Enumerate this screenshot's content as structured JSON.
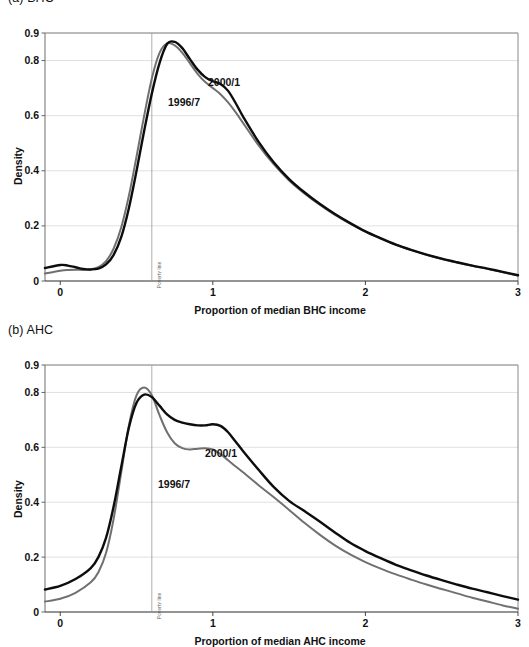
{
  "figure": {
    "panels": [
      {
        "id": "a",
        "title": "(a) BHC",
        "ylabel": "Density",
        "xlabel": "Proportion of median BHC income",
        "yticks": [
          "0",
          "0.2",
          "0.4",
          "0.6",
          "0.8",
          "0.9"
        ],
        "xticks": [
          "0",
          "1",
          "2",
          "3"
        ],
        "poverty_label": "Poverty line",
        "series_labels": {
          "new": "2000/1",
          "old": "1996/7"
        }
      },
      {
        "id": "b",
        "title": "(b) AHC",
        "ylabel": "Density",
        "xlabel": "Proportion of median AHC income",
        "yticks": [
          "0",
          "0.2",
          "0.4",
          "0.6",
          "0.8",
          "0.9"
        ],
        "xticks": [
          "0",
          "1",
          "2",
          "3"
        ],
        "poverty_label": "Poverty line",
        "series_labels": {
          "new": "2000/1",
          "old": "1996/7"
        }
      }
    ]
  },
  "colors": {
    "series_new": "#0d0d0d",
    "series_old": "#707070",
    "grid": "#d8d8d8",
    "axis": "#7a7a7a",
    "poverty_line": "#9a9a9a",
    "background": "#ffffff"
  },
  "chart_data": [
    {
      "type": "line",
      "title": "(a) BHC",
      "xlabel": "Proportion of median BHC income",
      "ylabel": "Density",
      "xlim": [
        -0.1,
        3.0
      ],
      "ylim": [
        0,
        0.9
      ],
      "xticks": [
        0,
        1,
        2,
        3
      ],
      "yticks": [
        0,
        0.2,
        0.4,
        0.6,
        0.8,
        0.9
      ],
      "grid": true,
      "legend": "inline-annotations",
      "annotations": [
        {
          "text": "Poverty line",
          "x": 0.6,
          "orientation": "vertical"
        },
        {
          "text": "2000/1",
          "x": 1.02,
          "y": 0.745,
          "series": "2000/1"
        },
        {
          "text": "1996/7",
          "x": 0.82,
          "y": 0.675,
          "series": "1996/7"
        }
      ],
      "x": [
        -0.1,
        0.0,
        0.05,
        0.1,
        0.15,
        0.2,
        0.25,
        0.3,
        0.35,
        0.4,
        0.45,
        0.5,
        0.55,
        0.6,
        0.65,
        0.7,
        0.75,
        0.8,
        0.85,
        0.9,
        0.95,
        1.0,
        1.05,
        1.1,
        1.15,
        1.2,
        1.3,
        1.4,
        1.5,
        1.6,
        1.7,
        1.8,
        1.9,
        2.0,
        2.1,
        2.2,
        2.3,
        2.4,
        2.5,
        2.6,
        2.7,
        2.8,
        2.9,
        3.0
      ],
      "series": [
        {
          "name": "2000/1",
          "color": "#0d0d0d",
          "values": [
            0.047,
            0.058,
            0.056,
            0.05,
            0.044,
            0.042,
            0.045,
            0.06,
            0.095,
            0.16,
            0.265,
            0.4,
            0.545,
            0.68,
            0.79,
            0.86,
            0.868,
            0.845,
            0.805,
            0.767,
            0.74,
            0.725,
            0.715,
            0.69,
            0.645,
            0.595,
            0.505,
            0.43,
            0.37,
            0.322,
            0.28,
            0.243,
            0.21,
            0.18,
            0.155,
            0.132,
            0.113,
            0.096,
            0.081,
            0.068,
            0.056,
            0.045,
            0.033,
            0.021
          ]
        },
        {
          "name": "1996/7",
          "color": "#707070",
          "values": [
            0.027,
            0.037,
            0.04,
            0.041,
            0.04,
            0.042,
            0.05,
            0.072,
            0.118,
            0.195,
            0.31,
            0.452,
            0.6,
            0.735,
            0.827,
            0.862,
            0.855,
            0.828,
            0.79,
            0.752,
            0.722,
            0.7,
            0.678,
            0.648,
            0.612,
            0.572,
            0.492,
            0.423,
            0.365,
            0.318,
            0.277,
            0.24,
            0.208,
            0.179,
            0.154,
            0.131,
            0.112,
            0.095,
            0.08,
            0.067,
            0.055,
            0.044,
            0.032,
            0.02
          ]
        }
      ]
    },
    {
      "type": "line",
      "title": "(b) AHC",
      "xlabel": "Proportion of median AHC income",
      "ylabel": "Density",
      "xlim": [
        -0.1,
        3.0
      ],
      "ylim": [
        0,
        0.9
      ],
      "xticks": [
        0,
        1,
        2,
        3
      ],
      "yticks": [
        0,
        0.2,
        0.4,
        0.6,
        0.8,
        0.9
      ],
      "grid": true,
      "legend": "inline-annotations",
      "annotations": [
        {
          "text": "Poverty line",
          "x": 0.6,
          "orientation": "vertical"
        },
        {
          "text": "2000/1",
          "x": 1.05,
          "y": 0.685,
          "series": "2000/1"
        },
        {
          "text": "1996/7",
          "x": 0.82,
          "y": 0.575,
          "series": "1996/7"
        }
      ],
      "x": [
        -0.1,
        0.0,
        0.1,
        0.2,
        0.25,
        0.3,
        0.35,
        0.4,
        0.45,
        0.5,
        0.55,
        0.6,
        0.65,
        0.7,
        0.75,
        0.8,
        0.85,
        0.9,
        0.95,
        1.0,
        1.05,
        1.1,
        1.15,
        1.2,
        1.3,
        1.4,
        1.5,
        1.6,
        1.7,
        1.8,
        1.9,
        2.0,
        2.1,
        2.2,
        2.3,
        2.4,
        2.5,
        2.6,
        2.7,
        2.8,
        2.9,
        3.0
      ],
      "series": [
        {
          "name": "2000/1",
          "color": "#0d0d0d",
          "values": [
            0.082,
            0.095,
            0.12,
            0.16,
            0.2,
            0.27,
            0.385,
            0.53,
            0.672,
            0.762,
            0.792,
            0.783,
            0.752,
            0.72,
            0.7,
            0.69,
            0.684,
            0.68,
            0.68,
            0.684,
            0.678,
            0.655,
            0.62,
            0.585,
            0.518,
            0.455,
            0.405,
            0.368,
            0.33,
            0.29,
            0.252,
            0.222,
            0.196,
            0.172,
            0.152,
            0.133,
            0.116,
            0.1,
            0.085,
            0.072,
            0.058,
            0.045
          ]
        },
        {
          "name": "1996/7",
          "color": "#707070",
          "values": [
            0.038,
            0.048,
            0.07,
            0.108,
            0.145,
            0.215,
            0.34,
            0.51,
            0.68,
            0.79,
            0.818,
            0.79,
            0.718,
            0.655,
            0.615,
            0.597,
            0.592,
            0.595,
            0.597,
            0.592,
            0.575,
            0.553,
            0.53,
            0.508,
            0.462,
            0.418,
            0.372,
            0.325,
            0.282,
            0.243,
            0.21,
            0.182,
            0.158,
            0.137,
            0.118,
            0.1,
            0.084,
            0.068,
            0.052,
            0.038,
            0.024,
            0.012
          ]
        }
      ]
    }
  ]
}
